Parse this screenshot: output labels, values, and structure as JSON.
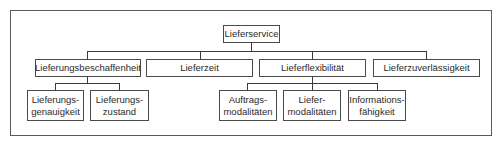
{
  "diagram": {
    "root": {
      "label": "Lieferservice"
    },
    "level2": [
      {
        "label": "Lieferungsbeschaffenheit"
      },
      {
        "label": "Lieferzeit"
      },
      {
        "label": "Lieferflexibilität"
      },
      {
        "label": "Lieferzuverlässigkeit"
      }
    ],
    "level3": [
      {
        "parent": "Lieferungsbeschaffenheit",
        "line1": "Lieferungs-",
        "line2": "genauigkeit"
      },
      {
        "parent": "Lieferungsbeschaffenheit",
        "line1": "Lieferungs-",
        "line2": "zustand"
      },
      {
        "parent": "Lieferflexibilität",
        "line1": "Auftrags-",
        "line2": "modalitäten"
      },
      {
        "parent": "Lieferflexibilität",
        "line1": "Liefer-",
        "line2": "modalitäten"
      },
      {
        "parent": "Lieferflexibilität",
        "line1": "Informations-",
        "line2": "fähigkeit"
      }
    ]
  }
}
